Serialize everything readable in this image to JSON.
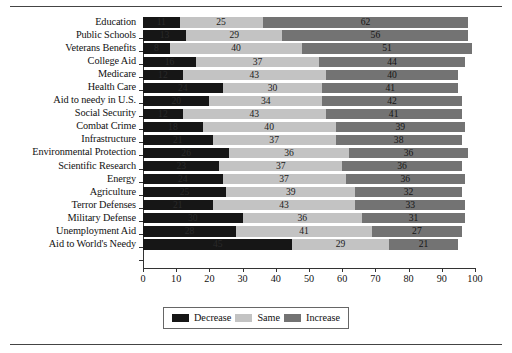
{
  "chart_data": {
    "type": "bar",
    "orientation": "horizontal",
    "stacked": true,
    "title": "",
    "xlabel": "",
    "ylabel": "",
    "xlim": [
      0,
      100
    ],
    "xticks": [
      0,
      10,
      20,
      30,
      40,
      50,
      60,
      70,
      80,
      90,
      100
    ],
    "grid": false,
    "legend_position": "bottom-center",
    "categories": [
      "Education",
      "Public Schools",
      "Veterans Benefits",
      "College Aid",
      "Medicare",
      "Health Care",
      "Aid to needy in U.S.",
      "Social Security",
      "Combat Crime",
      "Infrastructure",
      "Environmental Protection",
      "Scientific Research",
      "Energy",
      "Agriculture",
      "Terror Defenses",
      "Military Defense",
      "Unemployment Aid",
      "Aid to World's Needy"
    ],
    "series": [
      {
        "name": "Decrease",
        "color": "#161616",
        "values": [
          11,
          13,
          8,
          16,
          12,
          24,
          20,
          12,
          18,
          21,
          26,
          23,
          24,
          25,
          21,
          30,
          28,
          45
        ]
      },
      {
        "name": "Same",
        "color": "#c3c3c3",
        "values": [
          25,
          29,
          40,
          37,
          43,
          30,
          34,
          43,
          40,
          37,
          36,
          37,
          37,
          39,
          43,
          36,
          41,
          29
        ]
      },
      {
        "name": "Increase",
        "color": "#737373",
        "values": [
          62,
          56,
          51,
          44,
          40,
          41,
          42,
          41,
          39,
          38,
          36,
          36,
          36,
          32,
          33,
          31,
          27,
          21
        ]
      }
    ]
  },
  "legend": {
    "items": [
      {
        "label": "Decrease",
        "color": "#161616"
      },
      {
        "label": "Same",
        "color": "#c3c3c3"
      },
      {
        "label": "Increase",
        "color": "#737373"
      }
    ]
  }
}
